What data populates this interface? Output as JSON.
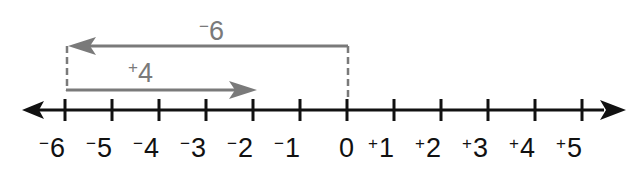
{
  "diagram": {
    "type": "number-line",
    "axis": {
      "min": -6,
      "max": 5,
      "ticks": [
        {
          "value": -6,
          "sign": "−",
          "digit": "6"
        },
        {
          "value": -5,
          "sign": "−",
          "digit": "5"
        },
        {
          "value": -4,
          "sign": "−",
          "digit": "4"
        },
        {
          "value": -3,
          "sign": "−",
          "digit": "3"
        },
        {
          "value": -2,
          "sign": "−",
          "digit": "2"
        },
        {
          "value": -1,
          "sign": "−",
          "digit": "1"
        },
        {
          "value": 0,
          "sign": "",
          "digit": "0"
        },
        {
          "value": 1,
          "sign": "+",
          "digit": "1"
        },
        {
          "value": 2,
          "sign": "+",
          "digit": "2"
        },
        {
          "value": 3,
          "sign": "+",
          "digit": "3"
        },
        {
          "value": 4,
          "sign": "+",
          "digit": "4"
        },
        {
          "value": 5,
          "sign": "+",
          "digit": "5"
        }
      ],
      "arrows": "both-ends"
    },
    "operations": [
      {
        "name": "minus-six",
        "sign": "−",
        "digit": "6",
        "from": 0,
        "to": -6,
        "color": "#7a7a7a"
      },
      {
        "name": "plus-four",
        "sign": "+",
        "digit": "4",
        "from": -6,
        "to": -2,
        "color": "#7a7a7a"
      }
    ],
    "colors": {
      "axis": "#111111",
      "operation": "#7a7a7a",
      "background": "#ffffff"
    }
  }
}
